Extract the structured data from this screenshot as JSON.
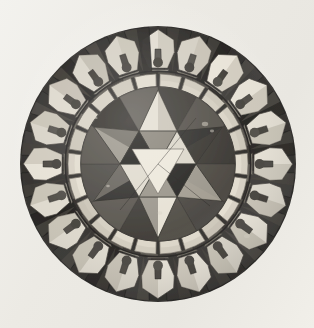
{
  "image": {
    "kind": "photograph",
    "subject": "circular-inlaid-stone-roundel",
    "description": "Black and white photograph of a circular inlaid stone disc with a central six-pointed star (hexagram) surrounded by a pale segmented ring and an outer band of pale keyhole-shaped tiles alternating with dark wedges.",
    "orientation": "upright",
    "background_color": "#eeece7",
    "width": 314,
    "height": 328
  },
  "disc": {
    "center_x": 158,
    "center_y": 164,
    "outer_radius": 138,
    "rim_color": "#2e2c29",
    "outer_ring": {
      "motif_count": 20,
      "motif_name": "keyhole-tile",
      "outer_radius": 137,
      "inner_radius": 93,
      "light_tile_color": "#ded9cd",
      "light_tile_shadow": "#b6b0a2",
      "dark_wedge_color": "#2b2926",
      "notch_color": "#45423c",
      "mid_grey_color": "#7b766c"
    },
    "band_ring": {
      "name": "pale-segmented-band",
      "outer_radius": 90,
      "inner_radius": 77,
      "segment_count": 22,
      "color": "#d8d2c4",
      "joint_color": "#6d685f"
    },
    "inner_field": {
      "name": "inner-dark-field",
      "radius": 77,
      "color": "#5e5a53"
    },
    "hexagram": {
      "name": "six-pointed-star",
      "point_count": 6,
      "outer_radius": 74,
      "inner_radius": 38,
      "hub_radius": 20,
      "light_color": "#dcd7ca",
      "mid_color": "#8d887d",
      "dark_color": "#262522",
      "shadow_color": "#4a4740"
    }
  },
  "colors": {
    "paper": "#eeece7",
    "highlight": "#e8e3d7",
    "light_stone": "#ded9cd",
    "mid_stone": "#8d887d",
    "dark_stone": "#2b2926",
    "deep_shadow": "#181715"
  }
}
